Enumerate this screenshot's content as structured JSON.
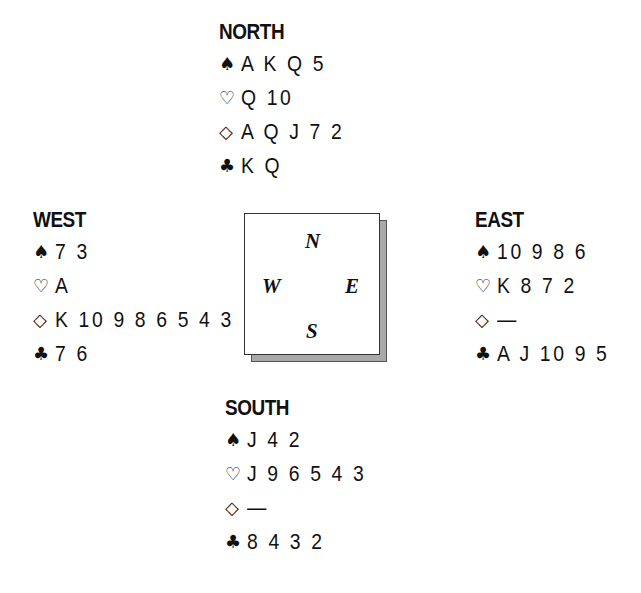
{
  "diagram": {
    "type": "bridge-deal",
    "suit_symbols": {
      "spades": "♠",
      "hearts": "♡",
      "diamonds": "◇",
      "clubs": "♣"
    },
    "compass": {
      "north": "N",
      "east": "E",
      "south": "S",
      "west": "W"
    },
    "hands": {
      "north": {
        "label": "NORTH",
        "spades": "A K Q 5",
        "hearts": "Q 10",
        "diamonds": "A Q J 7 2",
        "clubs": "K Q"
      },
      "west": {
        "label": "WEST",
        "spades": "7 3",
        "hearts": "A",
        "diamonds": "K 10 9 8 6 5 4 3",
        "clubs": "7 6"
      },
      "east": {
        "label": "EAST",
        "spades": "10 9 8 6",
        "hearts": "K 8 7 2",
        "diamonds": "—",
        "clubs": "A J 10 9 5"
      },
      "south": {
        "label": "SOUTH",
        "spades": "J 4 2",
        "hearts": "J 9 6 5 4 3",
        "diamonds": "—",
        "clubs": "8 4 3 2"
      }
    }
  }
}
